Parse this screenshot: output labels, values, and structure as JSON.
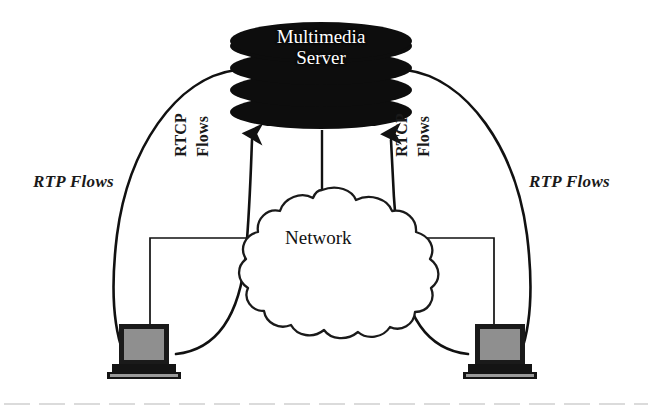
{
  "figure": {
    "type": "network-diagram",
    "background": "#ffffff",
    "ink_color": "#111111"
  },
  "server": {
    "name": "multimedia-server",
    "label_line1": "Multimedia",
    "label_line2": "Server",
    "shape": "stacked-disks",
    "disk_count": 5,
    "fill": "#0d0d0d",
    "text_color": "#ffffff"
  },
  "cloud": {
    "name": "network-cloud",
    "label": "Network",
    "fill": "#ffffff",
    "stroke": "#111111"
  },
  "clients": [
    {
      "name": "client-left",
      "position": "left",
      "screen_fill": "#8c8c8c",
      "body_fill": "#1a1a1a"
    },
    {
      "name": "client-right",
      "position": "right",
      "screen_fill": "#8c8c8c",
      "body_fill": "#1a1a1a"
    }
  ],
  "flows": [
    {
      "name": "rtp-flow-left",
      "label": "RTP Flows",
      "kind": "RTP",
      "side": "left",
      "arrow": false
    },
    {
      "name": "rtcp-flow-left",
      "label_line1": "RTCP",
      "label_line2": "Flows",
      "kind": "RTCP",
      "side": "left",
      "arrow": true
    },
    {
      "name": "rtcp-flow-right",
      "label_line1": "RTCP",
      "label_line2": "Flows",
      "kind": "RTCP",
      "side": "right",
      "arrow": true
    },
    {
      "name": "rtp-flow-right",
      "label": "RTP Flows",
      "kind": "RTP",
      "side": "right",
      "arrow": false
    }
  ],
  "labels": {
    "rtp_left": "RTP Flows",
    "rtp_right": "RTP Flows",
    "rtcp_left_line1": "RTCP",
    "rtcp_left_line2": "Flows",
    "rtcp_right_line1": "RTCP",
    "rtcp_right_line2": "Flows",
    "server_line1": "Multimedia",
    "server_line2": "Server",
    "network": "Network"
  }
}
